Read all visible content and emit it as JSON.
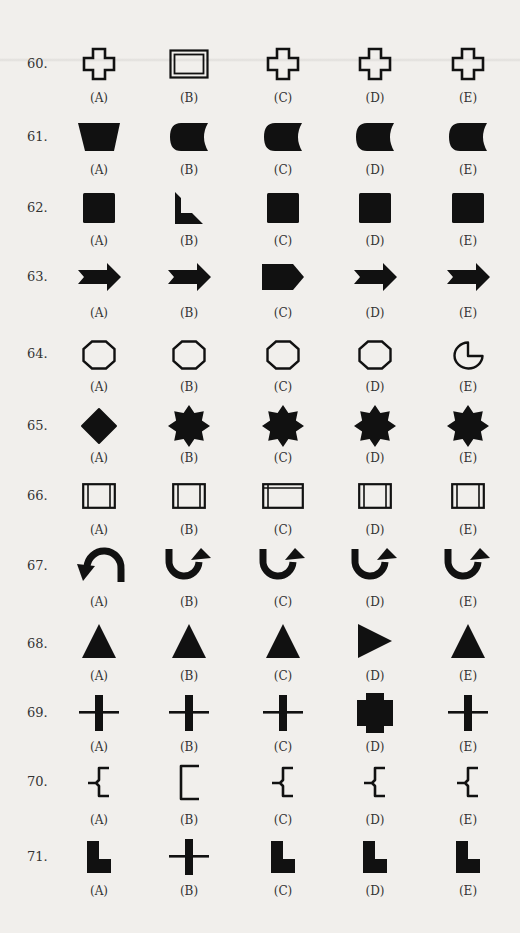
{
  "page": {
    "type": "figure-classification test sheet",
    "columns_x": [
      99,
      189,
      283,
      375,
      468
    ]
  },
  "questions": [
    {
      "number": "60.",
      "options": [
        {
          "label": "(A)",
          "shape": "outline-cross"
        },
        {
          "label": "(B)",
          "shape": "double-outline-rectangle"
        },
        {
          "label": "(C)",
          "shape": "outline-cross"
        },
        {
          "label": "(D)",
          "shape": "outline-cross"
        },
        {
          "label": "(E)",
          "shape": "outline-cross"
        }
      ]
    },
    {
      "number": "61.",
      "options": [
        {
          "label": "(A)",
          "shape": "filled-trapezoid"
        },
        {
          "label": "(B)",
          "shape": "filled-d-shape-concave-right"
        },
        {
          "label": "(C)",
          "shape": "filled-d-shape-concave-right"
        },
        {
          "label": "(D)",
          "shape": "filled-d-shape-concave-right"
        },
        {
          "label": "(E)",
          "shape": "filled-d-shape-concave-right"
        }
      ]
    },
    {
      "number": "62.",
      "options": [
        {
          "label": "(A)",
          "shape": "filled-square"
        },
        {
          "label": "(B)",
          "shape": "filled-l-bevel"
        },
        {
          "label": "(C)",
          "shape": "filled-square"
        },
        {
          "label": "(D)",
          "shape": "filled-square"
        },
        {
          "label": "(E)",
          "shape": "filled-square"
        }
      ]
    },
    {
      "number": "63.",
      "options": [
        {
          "label": "(A)",
          "shape": "filled-notched-arrow-right"
        },
        {
          "label": "(B)",
          "shape": "filled-notched-arrow-right"
        },
        {
          "label": "(C)",
          "shape": "filled-pentagon-arrow-right"
        },
        {
          "label": "(D)",
          "shape": "filled-notched-arrow-right"
        },
        {
          "label": "(E)",
          "shape": "filled-notched-arrow-right"
        }
      ]
    },
    {
      "number": "64.",
      "options": [
        {
          "label": "(A)",
          "shape": "outline-octagon"
        },
        {
          "label": "(B)",
          "shape": "outline-octagon"
        },
        {
          "label": "(C)",
          "shape": "outline-octagon"
        },
        {
          "label": "(D)",
          "shape": "outline-octagon"
        },
        {
          "label": "(E)",
          "shape": "outline-pacman"
        }
      ]
    },
    {
      "number": "65.",
      "options": [
        {
          "label": "(A)",
          "shape": "filled-diamond"
        },
        {
          "label": "(B)",
          "shape": "filled-8-point-star"
        },
        {
          "label": "(C)",
          "shape": "filled-8-point-star"
        },
        {
          "label": "(D)",
          "shape": "filled-8-point-star"
        },
        {
          "label": "(E)",
          "shape": "filled-8-point-star"
        }
      ]
    },
    {
      "number": "66.",
      "options": [
        {
          "label": "(A)",
          "shape": "square-double-sides"
        },
        {
          "label": "(B)",
          "shape": "square-double-sides"
        },
        {
          "label": "(C)",
          "shape": "rectangle-double-left-top"
        },
        {
          "label": "(D)",
          "shape": "square-double-sides"
        },
        {
          "label": "(E)",
          "shape": "square-double-sides"
        }
      ]
    },
    {
      "number": "67.",
      "options": [
        {
          "label": "(A)",
          "shape": "arch-arrow-left-down"
        },
        {
          "label": "(B)",
          "shape": "u-arrow-right-up"
        },
        {
          "label": "(C)",
          "shape": "u-arrow-right-up"
        },
        {
          "label": "(D)",
          "shape": "u-arrow-right-up"
        },
        {
          "label": "(E)",
          "shape": "u-arrow-right-up"
        }
      ]
    },
    {
      "number": "68.",
      "options": [
        {
          "label": "(A)",
          "shape": "filled-triangle-up"
        },
        {
          "label": "(B)",
          "shape": "filled-triangle-up"
        },
        {
          "label": "(C)",
          "shape": "filled-triangle-up"
        },
        {
          "label": "(D)",
          "shape": "filled-triangle-right"
        },
        {
          "label": "(E)",
          "shape": "filled-triangle-up"
        }
      ]
    },
    {
      "number": "69.",
      "options": [
        {
          "label": "(A)",
          "shape": "thin-cross-thick-vertical"
        },
        {
          "label": "(B)",
          "shape": "thin-cross-thick-vertical"
        },
        {
          "label": "(C)",
          "shape": "thin-cross-thick-vertical"
        },
        {
          "label": "(D)",
          "shape": "filled-blocky-cross"
        },
        {
          "label": "(E)",
          "shape": "thin-cross-thick-vertical"
        }
      ]
    },
    {
      "number": "70.",
      "options": [
        {
          "label": "(A)",
          "shape": "brace-left"
        },
        {
          "label": "(B)",
          "shape": "bracket-open-right"
        },
        {
          "label": "(C)",
          "shape": "brace-left"
        },
        {
          "label": "(D)",
          "shape": "brace-left"
        },
        {
          "label": "(E)",
          "shape": "brace-left"
        }
      ]
    },
    {
      "number": "71.",
      "options": [
        {
          "label": "(A)",
          "shape": "filled-l-block"
        },
        {
          "label": "(B)",
          "shape": "thin-cross-thick-vertical"
        },
        {
          "label": "(C)",
          "shape": "filled-l-block"
        },
        {
          "label": "(D)",
          "shape": "filled-l-block"
        },
        {
          "label": "(E)",
          "shape": "filled-l-block"
        }
      ]
    }
  ]
}
